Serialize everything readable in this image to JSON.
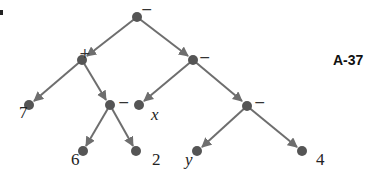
{
  "figure": {
    "tag": "A-37",
    "colors": {
      "edge": "#6e6e6e",
      "node": "#555555",
      "text": "#222222"
    }
  },
  "tree": {
    "root": {
      "label": "−"
    },
    "plus": {
      "label": "+"
    },
    "minus_right": {
      "label": "−"
    },
    "minus_left_inner": {
      "label": "−"
    },
    "minus_right_inner": {
      "label": "−"
    },
    "leaves": {
      "seven": "7",
      "x": "x",
      "six": "6",
      "two": "2",
      "y": "y",
      "four": "4"
    }
  }
}
